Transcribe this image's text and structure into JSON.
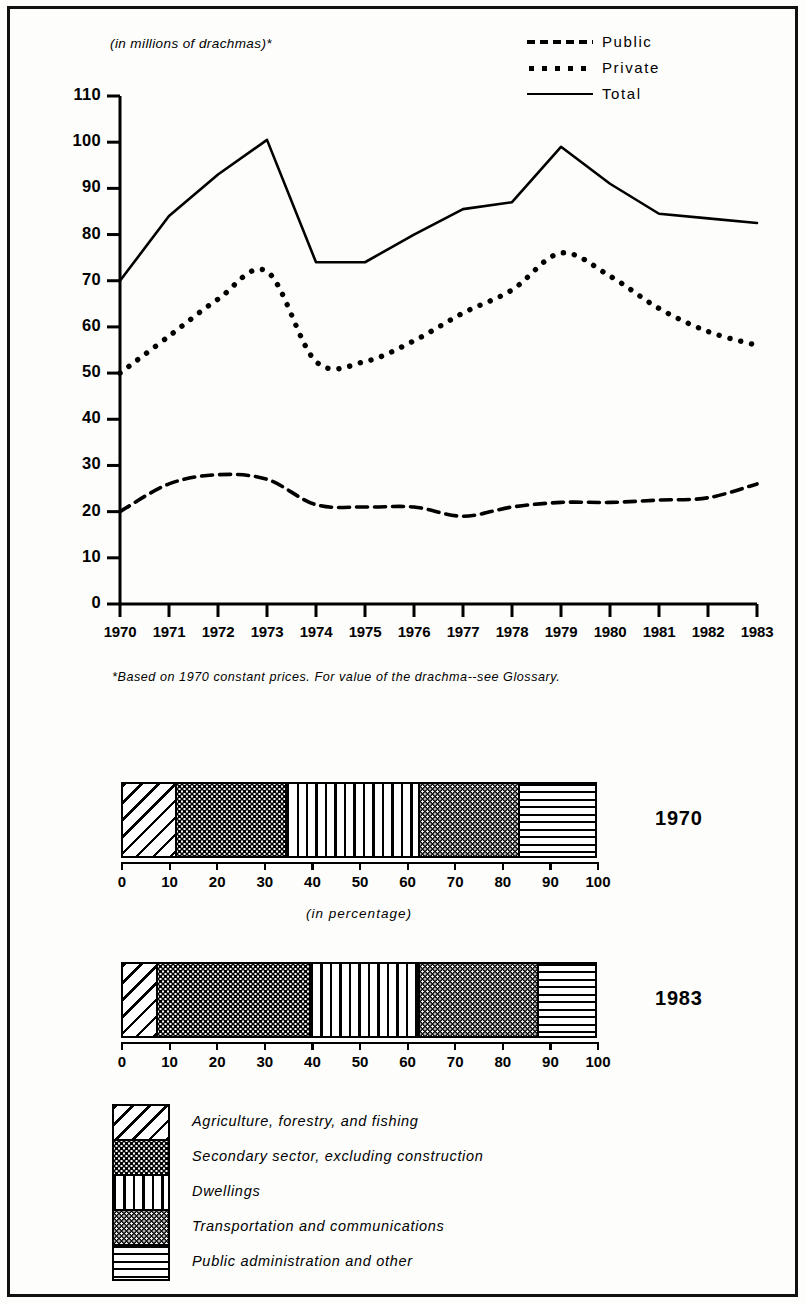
{
  "line_chart": {
    "unit_label": "(in millions of drachmas)*",
    "footnote": "*Based on 1970 constant prices.  For value of the drachma--see Glossary.",
    "legend": [
      {
        "label": "Public",
        "style": "dashed"
      },
      {
        "label": "Private",
        "style": "dotted"
      },
      {
        "label": "Total",
        "style": "solid"
      }
    ]
  },
  "bars": {
    "percent_caption": "(in percentage)",
    "axis_ticks": [
      "0",
      "10",
      "20",
      "30",
      "40",
      "50",
      "60",
      "70",
      "80",
      "90",
      "100"
    ],
    "groups": [
      {
        "year": "1970",
        "segments": [
          {
            "category": "Agriculture, forestry, and fishing",
            "value": 11
          },
          {
            "category": "Secondary sector, excluding construction",
            "value": 23
          },
          {
            "category": "Dwellings",
            "value": 28
          },
          {
            "category": "Transportation and communications",
            "value": 21
          },
          {
            "category": "Public administration and other",
            "value": 17
          }
        ]
      },
      {
        "year": "1983",
        "segments": [
          {
            "category": "Agriculture, forestry, and fishing",
            "value": 7
          },
          {
            "category": "Secondary sector, excluding construction",
            "value": 32
          },
          {
            "category": "Dwellings",
            "value": 23
          },
          {
            "category": "Transportation and communications",
            "value": 25
          },
          {
            "category": "Public administration and other",
            "value": 13
          }
        ]
      }
    ]
  },
  "bottom_legend": [
    {
      "label": "Agriculture, forestry, and fishing",
      "pattern": "diagonal-hatch"
    },
    {
      "label": "Secondary sector, excluding construction",
      "pattern": "light-dots"
    },
    {
      "label": "Dwellings",
      "pattern": "vertical-lines"
    },
    {
      "label": "Transportation and communications",
      "pattern": "dark-dots"
    },
    {
      "label": "Public administration and other",
      "pattern": "horizontal-lines"
    }
  ],
  "chart_data": [
    {
      "type": "line",
      "title": "",
      "xlabel": "",
      "ylabel": "(in millions of drachmas)*",
      "x": [
        1970,
        1971,
        1972,
        1973,
        1974,
        1975,
        1976,
        1977,
        1978,
        1979,
        1980,
        1981,
        1982,
        1983
      ],
      "xtick_labels": [
        "1970",
        "1971",
        "1972",
        "1973",
        "1974",
        "1975",
        "1976",
        "1977",
        "1978",
        "1979",
        "1980",
        "1981",
        "1982",
        "1983"
      ],
      "ylim": [
        0,
        110
      ],
      "ytick_labels": [
        "0",
        "10",
        "20",
        "30",
        "40",
        "50",
        "60",
        "70",
        "80",
        "90",
        "100",
        "110"
      ],
      "grid": false,
      "legend_position": "top-right",
      "series": [
        {
          "name": "Public",
          "style": "dashed",
          "values": [
            20,
            26,
            28,
            27,
            21.5,
            21,
            21,
            19,
            21,
            22,
            22,
            22.5,
            23,
            26
          ]
        },
        {
          "name": "Private",
          "style": "dotted",
          "values": [
            50,
            58,
            66,
            72,
            52.5,
            52.5,
            57,
            63,
            68,
            76,
            71,
            64,
            59,
            56
          ]
        },
        {
          "name": "Total",
          "style": "solid",
          "values": [
            70,
            84,
            93,
            100.5,
            74,
            74,
            80,
            85.5,
            87,
            99,
            91,
            84.5,
            83.5,
            82.5
          ]
        }
      ]
    },
    {
      "type": "bar",
      "orientation": "horizontal-stacked",
      "title": "1970",
      "xlabel": "(in percentage)",
      "xlim": [
        0,
        100
      ],
      "categories": [
        "Agriculture, forestry, and fishing",
        "Secondary sector, excluding construction",
        "Dwellings",
        "Transportation and communications",
        "Public administration and other"
      ],
      "values": [
        11,
        23,
        28,
        21,
        17
      ],
      "cumulative_boundaries": [
        0,
        11,
        34,
        62,
        83,
        100
      ]
    },
    {
      "type": "bar",
      "orientation": "horizontal-stacked",
      "title": "1983",
      "xlabel": "(in percentage)",
      "xlim": [
        0,
        100
      ],
      "categories": [
        "Agriculture, forestry, and fishing",
        "Secondary sector, excluding construction",
        "Dwellings",
        "Transportation and communications",
        "Public administration and other"
      ],
      "values": [
        7,
        32,
        23,
        25,
        13
      ],
      "cumulative_boundaries": [
        0,
        7,
        39,
        62,
        87,
        100
      ]
    }
  ]
}
